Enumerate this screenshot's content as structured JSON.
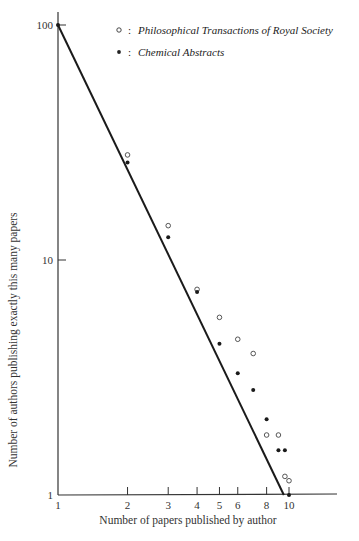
{
  "chart_data": {
    "type": "scatter",
    "title": "",
    "xlabel": "Number of papers published by author",
    "ylabel": "Number of authors publishing exactly this many papers",
    "xscale": "log",
    "yscale": "log",
    "xlim": [
      1,
      14
    ],
    "ylim": [
      1,
      100
    ],
    "grid": false,
    "legend_position": "upper right",
    "x_ticks": [
      1,
      2,
      3,
      4,
      5,
      6,
      8,
      10
    ],
    "x_tick_labels": [
      "1",
      "2",
      "3",
      "4",
      "5",
      "6",
      "8",
      "10"
    ],
    "y_ticks": [
      1,
      10,
      100
    ],
    "y_tick_labels": [
      "1",
      "10",
      "100"
    ],
    "series": [
      {
        "name": "Philosophical Transactions of Royal Society",
        "marker": "open-circle",
        "x": [
          2,
          3,
          4,
          5,
          6,
          7,
          8,
          9,
          9.6,
          10
        ],
        "y": [
          28,
          14,
          7.5,
          5.7,
          4.6,
          4.0,
          1.8,
          1.8,
          1.2,
          1.15
        ]
      },
      {
        "name": "Chemical Abstracts",
        "marker": "filled-circle",
        "x": [
          1,
          2,
          3,
          4,
          5,
          6,
          7,
          8,
          9,
          9.6,
          10
        ],
        "y": [
          100,
          26,
          12.5,
          7.3,
          4.4,
          3.3,
          2.8,
          2.1,
          1.55,
          1.55,
          1
        ]
      },
      {
        "name": "Inverse-square law (Lotka)",
        "type": "line",
        "x": [
          1,
          10
        ],
        "y": [
          100,
          1
        ]
      }
    ],
    "legend": [
      {
        "marker": "○",
        "separator": ":",
        "label": "Philosophical Transactions of Royal Society"
      },
      {
        "marker": "•",
        "separator": ":",
        "label": "Chemical Abstracts"
      }
    ]
  }
}
